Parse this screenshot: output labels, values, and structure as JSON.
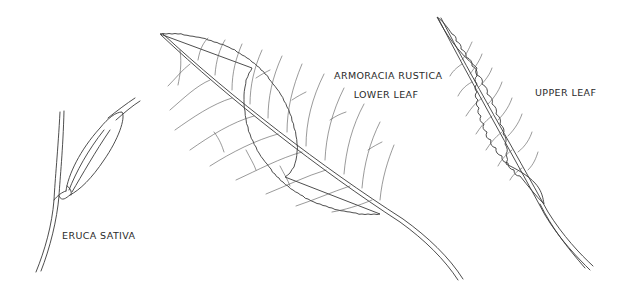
{
  "plate": {
    "background": "#ffffff",
    "line_color": "#3a3a3a",
    "specimens": [
      {
        "id": "eruca",
        "label": "ERUCA SATIVA"
      },
      {
        "id": "armoracia-lower",
        "label_line1": "ARMORACIA RUSTICA",
        "label_line2": "LOWER LEAF"
      },
      {
        "id": "armoracia-upper",
        "label": "UPPER LEAF"
      }
    ]
  }
}
